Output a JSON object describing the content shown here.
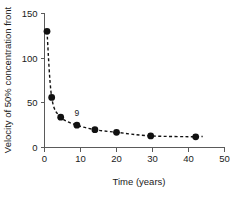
{
  "chart_data": {
    "type": "line",
    "title": "",
    "xlabel": "Time (years)",
    "ylabel": "Velocity of 50% concentration front",
    "xlim": [
      0,
      50
    ],
    "ylim": [
      0,
      150
    ],
    "xticks": [
      0,
      10,
      20,
      30,
      40,
      50
    ],
    "xtick_labels": [
      "0",
      "10",
      "20",
      "30",
      "40",
      "50"
    ],
    "yticks": [
      0,
      50,
      100,
      150
    ],
    "ytick_labels": [
      "0",
      "50",
      "100",
      "150"
    ],
    "grid": false,
    "legend": null,
    "marker": "filled-circle",
    "line_style": "dashed",
    "x": [
      0.7,
      2.0,
      4.5,
      9.0,
      14.0,
      20.0,
      29.5,
      42.0
    ],
    "values": [
      130,
      56,
      34,
      25,
      20,
      17,
      13,
      12
    ],
    "annotations": [
      {
        "text": "9",
        "x": 9.0,
        "y": 25,
        "dx": 0,
        "dy": -9
      }
    ]
  },
  "axis_labels": {
    "x_title": "Time (years)",
    "y_title": "Velocity of 50% concentration front"
  },
  "colors": {
    "marker": "#111111",
    "line": "#111111",
    "axis": "#5a5a5a",
    "text": "#1a1a1a",
    "background": "#ffffff"
  }
}
